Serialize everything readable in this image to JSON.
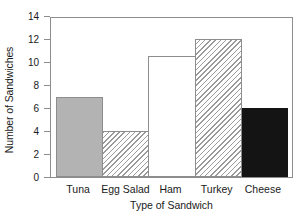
{
  "chart_data": {
    "type": "bar",
    "title": "",
    "xlabel": "Type of Sandwich",
    "ylabel": "Number of Sandwiches",
    "categories": [
      "Tuna",
      "Egg Salad",
      "Ham",
      "Turkey",
      "Cheese"
    ],
    "values": [
      7,
      4,
      10.5,
      12,
      6
    ],
    "ylim": [
      0,
      14
    ],
    "ytick_labels": [
      "0",
      "2",
      "4",
      "6",
      "8",
      "10",
      "12",
      "14"
    ],
    "ytick_values": [
      0,
      2,
      4,
      6,
      8,
      10,
      12,
      14
    ],
    "grid": false,
    "legend": "none",
    "bar_styles": [
      "solid-gray",
      "hatch",
      "white",
      "hatch",
      "solid-black"
    ],
    "colors": {
      "tuna_fill": "#b3b3b3",
      "egg_salad_fill": "#ffffff",
      "ham_fill": "#ffffff",
      "turkey_fill": "#ffffff",
      "cheese_fill": "#141414",
      "outline": "#8d8d8d",
      "hatch_line": "#9a9a9a",
      "background": "#ffffff",
      "text": "#1a1a1a"
    }
  }
}
